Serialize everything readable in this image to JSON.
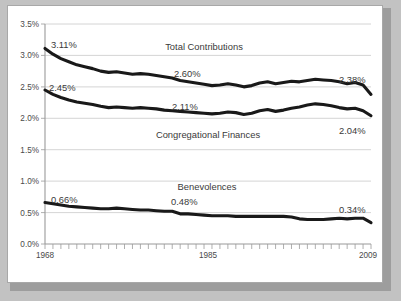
{
  "chart_data": {
    "type": "line",
    "title": "",
    "xlabel": "",
    "ylabel": "",
    "xlim": [
      1968,
      2009
    ],
    "ylim": [
      0.0,
      3.5
    ],
    "grid": true,
    "legend_position": "inline-annotations",
    "y_tick_labels": [
      "0.0%",
      "0.5%",
      "1.0%",
      "1.5%",
      "2.0%",
      "2.5%",
      "3.0%",
      "3.5%"
    ],
    "y_tick_values": [
      0.0,
      0.5,
      1.0,
      1.5,
      2.0,
      2.5,
      3.0,
      3.5
    ],
    "x_tick_labels": [
      "1968",
      "1985",
      "2009"
    ],
    "x_tick_values": [
      1968,
      1985,
      2009
    ],
    "x_minor_tick_step": 1,
    "x": [
      1968,
      1969,
      1970,
      1971,
      1972,
      1973,
      1974,
      1975,
      1976,
      1977,
      1978,
      1979,
      1980,
      1981,
      1982,
      1983,
      1984,
      1985,
      1986,
      1987,
      1988,
      1989,
      1990,
      1991,
      1992,
      1993,
      1994,
      1995,
      1996,
      1997,
      1998,
      1999,
      2000,
      2001,
      2002,
      2003,
      2004,
      2005,
      2006,
      2007,
      2008,
      2009
    ],
    "series": [
      {
        "name": "Total Contributions",
        "color": "#191919",
        "values": [
          3.11,
          3.02,
          2.95,
          2.9,
          2.85,
          2.82,
          2.79,
          2.75,
          2.73,
          2.74,
          2.72,
          2.7,
          2.71,
          2.7,
          2.68,
          2.66,
          2.64,
          2.6,
          2.58,
          2.56,
          2.54,
          2.52,
          2.53,
          2.55,
          2.53,
          2.5,
          2.52,
          2.56,
          2.58,
          2.55,
          2.57,
          2.59,
          2.58,
          2.6,
          2.62,
          2.61,
          2.6,
          2.58,
          2.55,
          2.57,
          2.53,
          2.38
        ],
        "start_label": "3.11%",
        "mid_label": "2.60%",
        "end_label": "2.38%"
      },
      {
        "name": "Congregational Finances",
        "color": "#191919",
        "values": [
          2.45,
          2.38,
          2.33,
          2.29,
          2.26,
          2.24,
          2.22,
          2.19,
          2.17,
          2.18,
          2.17,
          2.16,
          2.17,
          2.16,
          2.15,
          2.13,
          2.12,
          2.11,
          2.1,
          2.09,
          2.08,
          2.07,
          2.08,
          2.1,
          2.09,
          2.06,
          2.08,
          2.12,
          2.14,
          2.11,
          2.13,
          2.16,
          2.18,
          2.21,
          2.23,
          2.22,
          2.2,
          2.17,
          2.15,
          2.16,
          2.12,
          2.04
        ],
        "start_label": "2.45%",
        "mid_label": "2.11%",
        "end_label": "2.04%"
      },
      {
        "name": "Benevolences",
        "color": "#191919",
        "values": [
          0.66,
          0.64,
          0.62,
          0.6,
          0.59,
          0.58,
          0.57,
          0.56,
          0.56,
          0.57,
          0.56,
          0.55,
          0.54,
          0.54,
          0.53,
          0.52,
          0.52,
          0.48,
          0.48,
          0.47,
          0.46,
          0.45,
          0.45,
          0.45,
          0.44,
          0.44,
          0.44,
          0.44,
          0.44,
          0.44,
          0.44,
          0.43,
          0.4,
          0.39,
          0.39,
          0.39,
          0.4,
          0.41,
          0.4,
          0.41,
          0.41,
          0.34
        ],
        "start_label": "0.66%",
        "mid_label": "0.48%",
        "end_label": "0.34%"
      }
    ],
    "annotations": [
      {
        "text": "Total Contributions",
        "kind": "series-name"
      },
      {
        "text": "2.60%",
        "kind": "value-label"
      },
      {
        "text": "3.11%",
        "kind": "value-label"
      },
      {
        "text": "2.38%",
        "kind": "value-label"
      },
      {
        "text": "2.45%",
        "kind": "value-label"
      },
      {
        "text": "2.11%",
        "kind": "value-label"
      },
      {
        "text": "Congregational Finances",
        "kind": "series-name"
      },
      {
        "text": "2.04%",
        "kind": "value-label"
      },
      {
        "text": "0.66%",
        "kind": "value-label"
      },
      {
        "text": "Benevolences",
        "kind": "series-name"
      },
      {
        "text": "0.48%",
        "kind": "value-label"
      },
      {
        "text": "0.34%",
        "kind": "value-label"
      }
    ]
  },
  "labels": {
    "y0": "0.0%",
    "y1": "0.5%",
    "y2": "1.0%",
    "y3": "1.5%",
    "y4": "2.0%",
    "y5": "2.5%",
    "y6": "3.0%",
    "y7": "3.5%",
    "x_start": "1968",
    "x_mid": "1985",
    "x_end": "2009",
    "name_total": "Total Contributions",
    "name_cong": "Congregational Finances",
    "name_benev": "Benevolences",
    "total_start": "3.11%",
    "total_mid": "2.60%",
    "total_end": "2.38%",
    "cong_start": "2.45%",
    "cong_mid": "2.11%",
    "cong_end": "2.04%",
    "benev_start": "0.66%",
    "benev_mid": "0.48%",
    "benev_end": "0.34%"
  }
}
